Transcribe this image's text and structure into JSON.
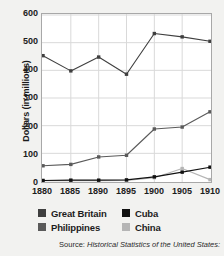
{
  "chart_data": {
    "type": "line",
    "title": "",
    "xlabel": "",
    "ylabel": "Dollars (in millions)",
    "categories": [
      "1880",
      "1885",
      "1890",
      "1895",
      "1900",
      "1905",
      "1910"
    ],
    "x": [
      1880,
      1885,
      1890,
      1895,
      1900,
      1905,
      1910
    ],
    "xlim": [
      1880,
      1910
    ],
    "ylim": [
      0,
      600
    ],
    "yticks": [
      "0",
      "100",
      "200",
      "300",
      "400",
      "500",
      "600"
    ],
    "ytick_values": [
      0,
      100,
      200,
      300,
      400,
      500,
      600
    ],
    "grid": true,
    "legend_position": "bottom",
    "series": [
      {
        "name": "Great Britain",
        "color": "#3f3f3f",
        "marker": "square",
        "values": [
          453,
          398,
          448,
          386,
          533,
          521,
          505
        ]
      },
      {
        "name": "Cuba",
        "color": "#111111",
        "marker": "square",
        "values": [
          2,
          3,
          3,
          4,
          15,
          32,
          50
        ]
      },
      {
        "name": "Philippines",
        "color": "#5a5a5a",
        "marker": "square",
        "values": [
          55,
          60,
          87,
          93,
          188,
          195,
          250
        ]
      },
      {
        "name": "China",
        "color": "#b5b5b5",
        "marker": "square",
        "values": [
          1,
          1,
          1,
          2,
          12,
          45,
          5
        ]
      }
    ]
  },
  "legend": {
    "items": [
      {
        "label": "Great Britain",
        "color": "#3f3f3f"
      },
      {
        "label": "Cuba",
        "color": "#111111"
      },
      {
        "label": "Philippines",
        "color": "#5a5a5a"
      },
      {
        "label": "China",
        "color": "#b5b5b5"
      }
    ]
  },
  "source": {
    "lead": "Source: ",
    "title": "Historical Statistics of the United States:"
  }
}
